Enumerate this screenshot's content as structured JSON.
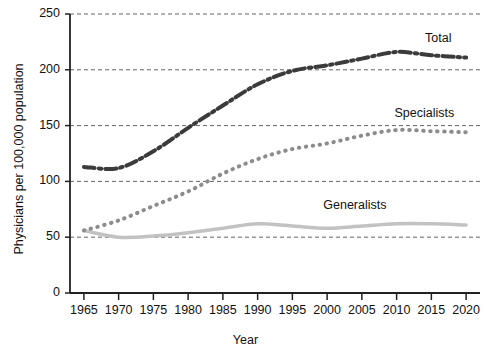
{
  "chart_data": {
    "type": "line",
    "title": "",
    "xlabel": "Year",
    "ylabel": "Physicians per 100,000 population",
    "xlim": [
      1963,
      2022
    ],
    "ylim": [
      0,
      250
    ],
    "ytick_values": [
      0,
      50,
      100,
      150,
      200,
      250
    ],
    "ytick_labels": [
      "0",
      "50",
      "100",
      "150",
      "200",
      "250"
    ],
    "xtick_values": [
      1965,
      1970,
      1975,
      1980,
      1985,
      1990,
      1995,
      2000,
      2005,
      2010,
      2015,
      2020
    ],
    "xtick_labels": [
      "1965",
      "1970",
      "1975",
      "1980",
      "1985",
      "1990",
      "1995",
      "2000",
      "2005",
      "2010",
      "2015",
      "2020"
    ],
    "grid": "horizontal-dashed",
    "legend_position": "inline-right-of-series",
    "x": [
      1965,
      1970,
      1975,
      1980,
      1985,
      1990,
      1995,
      2000,
      2005,
      2010,
      2015,
      2020
    ],
    "series": [
      {
        "name": "Total",
        "color": "#3b3b3b",
        "style": "dash-dot",
        "width": 4,
        "label_x": 2016,
        "label_y": 228,
        "values": [
          113,
          112,
          127,
          148,
          168,
          187,
          199,
          204,
          210,
          216,
          213,
          211
        ]
      },
      {
        "name": "Specialists",
        "color": "#8c8c8c",
        "style": "dotted",
        "width": 4,
        "label_x": 2014,
        "label_y": 160,
        "values": [
          56,
          65,
          78,
          91,
          107,
          120,
          129,
          134,
          141,
          146,
          145,
          144
        ]
      },
      {
        "name": "Generalists",
        "color": "#c2c2c2",
        "style": "solid",
        "width": 3.5,
        "label_x": 2004,
        "label_y": 78,
        "values": [
          56,
          50,
          51,
          54,
          58,
          62,
          60,
          58,
          60,
          62,
          62,
          61
        ]
      }
    ]
  }
}
